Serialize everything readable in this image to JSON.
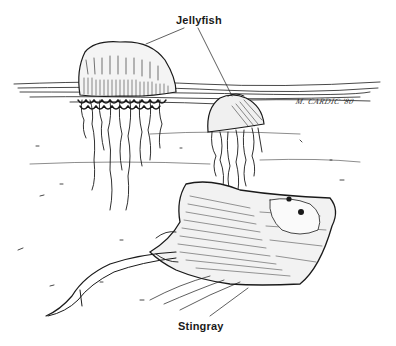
{
  "figure": {
    "labels": {
      "jellyfish": "Jellyfish",
      "stingray": "Stingray"
    },
    "signature": "M. CARDIC '80",
    "subjects": [
      "portuguese-man-o-war-jellyfish",
      "bell-jellyfish",
      "stingray"
    ],
    "colors": {
      "ink": "#1a1a1a",
      "background": "#ffffff"
    }
  }
}
